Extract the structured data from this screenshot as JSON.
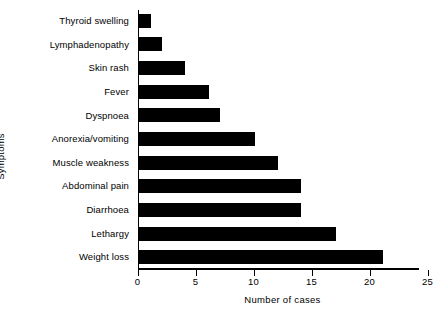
{
  "chart_data": {
    "type": "bar",
    "orientation": "horizontal",
    "title": "",
    "xlabel": "Number of cases",
    "ylabel": "Symptoms",
    "categories": [
      "Thyroid swelling",
      "Lymphadenopathy",
      "Skin rash",
      "Fever",
      "Dyspnoea",
      "Anorexia/vomiting",
      "Muscle weakness",
      "Abdominal pain",
      "Diarrhoea",
      "Lethargy",
      "Weight loss"
    ],
    "values": [
      1,
      2,
      4,
      6,
      7,
      10,
      12,
      14,
      14,
      17,
      21
    ],
    "xlim": [
      0,
      25
    ],
    "xticks": [
      0,
      5,
      10,
      15,
      20,
      25
    ],
    "xtick_labels": [
      "0",
      "5",
      "10",
      "15",
      "20",
      "25"
    ],
    "grid": false,
    "legend": false,
    "bar_color": "#000000",
    "background_color": "#ffffff"
  }
}
